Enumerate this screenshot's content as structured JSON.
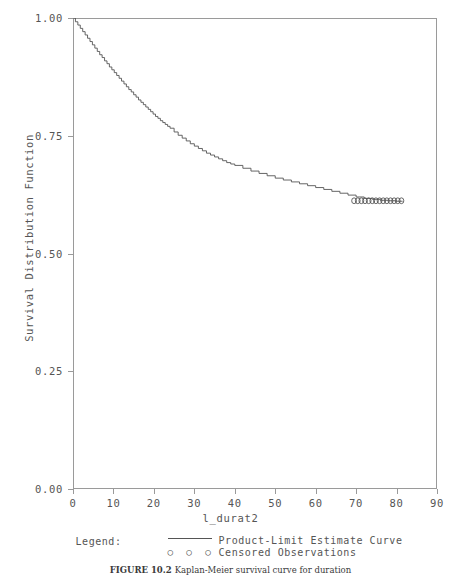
{
  "figure": {
    "y_axis_title": "Survival Distribution Function",
    "x_axis_title": "l_durat2",
    "caption_label": "FIGURE 10.2",
    "caption_rest": "Kaplan-Meier survival curve for duration"
  },
  "legend": {
    "title": "Legend:",
    "curve_label": "Product-Limit Estimate Curve",
    "censored_label": "Censored Observations",
    "censored_marker": "○ ○ ○"
  },
  "chart_data": {
    "type": "line",
    "title": "",
    "subtitle": "",
    "xlabel": "l_durat2",
    "ylabel": "Survival Distribution Function",
    "xlim": [
      0,
      90
    ],
    "ylim": [
      0.0,
      1.0
    ],
    "xticks": [
      0,
      10,
      20,
      30,
      40,
      50,
      60,
      70,
      80,
      90
    ],
    "ytick_values": [
      0.0,
      0.25,
      0.5,
      0.75,
      1.0
    ],
    "ytick_labels": [
      "0.00",
      "0.25",
      "0.50",
      "0.75",
      "1.00"
    ],
    "grid": false,
    "legend_position": "below-axes",
    "series": [
      {
        "name": "Product-Limit Estimate Curve",
        "style": "step",
        "color": "#555555",
        "x": [
          0,
          0.6,
          1.2,
          1.8,
          2.4,
          3.0,
          3.6,
          4.2,
          4.8,
          5.4,
          6.0,
          6.6,
          7.2,
          7.8,
          8.4,
          9.0,
          9.6,
          10.2,
          10.8,
          11.4,
          12.0,
          12.6,
          13.2,
          13.8,
          14.4,
          15.0,
          15.6,
          16.2,
          16.8,
          17.4,
          18.0,
          18.6,
          19.2,
          19.8,
          20.4,
          21.0,
          21.6,
          22.2,
          22.8,
          23.4,
          24.0,
          25.0,
          26.0,
          27.0,
          28.0,
          29.0,
          30.0,
          31.0,
          32.0,
          33.0,
          34.0,
          35.0,
          36.0,
          37.0,
          38.0,
          39.0,
          40.0,
          42.0,
          44.0,
          46.0,
          48.0,
          50.0,
          52.0,
          54.0,
          56.0,
          58.0,
          60.0,
          62.0,
          64.0,
          66.0,
          68.0,
          70.0,
          72.0,
          74.0,
          76.0,
          78.0,
          80.0,
          81.5
        ],
        "y": [
          1.0,
          0.992,
          0.985,
          0.978,
          0.971,
          0.964,
          0.957,
          0.95,
          0.943,
          0.936,
          0.929,
          0.922,
          0.916,
          0.909,
          0.903,
          0.896,
          0.89,
          0.884,
          0.878,
          0.872,
          0.866,
          0.86,
          0.854,
          0.848,
          0.843,
          0.837,
          0.832,
          0.826,
          0.821,
          0.816,
          0.811,
          0.806,
          0.801,
          0.796,
          0.791,
          0.787,
          0.782,
          0.778,
          0.774,
          0.77,
          0.766,
          0.758,
          0.751,
          0.745,
          0.739,
          0.733,
          0.728,
          0.723,
          0.718,
          0.713,
          0.709,
          0.705,
          0.701,
          0.697,
          0.693,
          0.69,
          0.687,
          0.681,
          0.675,
          0.67,
          0.665,
          0.66,
          0.656,
          0.652,
          0.648,
          0.644,
          0.64,
          0.636,
          0.632,
          0.628,
          0.624,
          0.62,
          0.617,
          0.615,
          0.613,
          0.612,
          0.611,
          0.611
        ]
      },
      {
        "name": "Censored Observations",
        "style": "markers",
        "marker": "circle",
        "color": "#555555",
        "x": [
          69.5,
          70.4,
          71.3,
          72.2,
          73.1,
          74.0,
          74.9,
          75.8,
          76.7,
          77.6,
          78.5,
          79.4,
          80.3,
          81.2
        ],
        "y": [
          0.612,
          0.612,
          0.612,
          0.612,
          0.612,
          0.612,
          0.612,
          0.612,
          0.612,
          0.612,
          0.612,
          0.612,
          0.612,
          0.612
        ]
      }
    ]
  }
}
